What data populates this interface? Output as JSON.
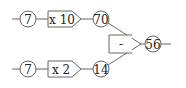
{
  "diagram": {
    "type": "arithmetic-flow",
    "top_row": {
      "input": "7",
      "operation": "x 10",
      "result": "70"
    },
    "bottom_row": {
      "input": "7",
      "operation": "x 2",
      "result": "14"
    },
    "combine": {
      "operation": "-",
      "result": "56"
    },
    "colors": {
      "stroke": "#555555",
      "fill": "#ffffff",
      "text": "#222222"
    }
  }
}
